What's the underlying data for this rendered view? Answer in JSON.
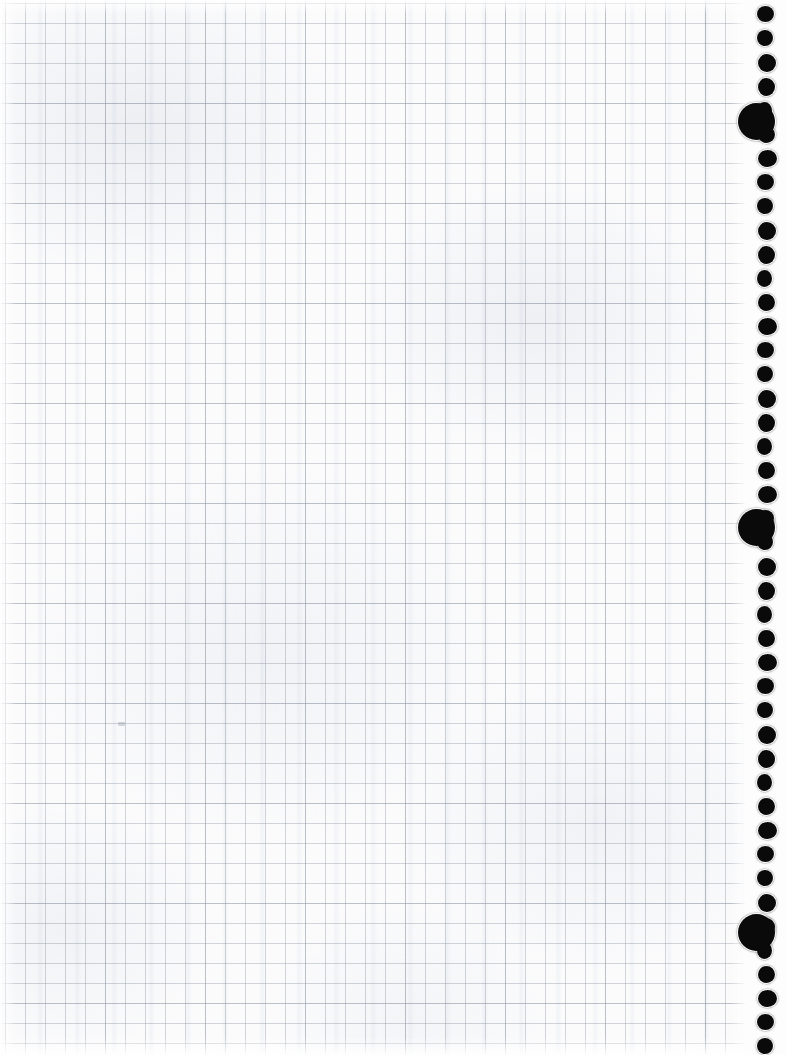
{
  "document": {
    "kind": "scanned-graph-paper-sheet",
    "title": "Blank quad-ruled graph paper page",
    "visible_text": "",
    "width_px": 786,
    "height_px": 1055
  },
  "paper": {
    "background_color": "#fbfbfc",
    "grid_line_color": "#969eaa",
    "grid_square_px": 20,
    "grid_origin_x_px": 5,
    "grid_origin_y_px": 3,
    "grid_area_width_px": 745,
    "accent_block_px": 100
  },
  "punch_margin": {
    "label": "spiral-bound punched edge",
    "left_px": 745,
    "width_px": 41,
    "background_color": "#fdfdfd",
    "hole_color": "#0a0a0a"
  },
  "holes": {
    "small_diameter_px": 17,
    "large_diameter_px": 37,
    "small_spacing_px": 24,
    "center_x_px": 766,
    "large_center_x_px": 756,
    "large_centers_y_px": [
      121,
      527,
      932
    ],
    "small_centers_y_px": [
      14,
      38,
      62,
      86,
      110,
      134,
      158,
      182,
      206,
      230,
      254,
      278,
      302,
      326,
      350,
      374,
      398,
      422,
      446,
      470,
      494,
      518,
      542,
      566,
      590,
      614,
      638,
      662,
      686,
      710,
      734,
      758,
      782,
      806,
      830,
      854,
      878,
      902,
      926,
      950,
      974,
      998,
      1022,
      1046
    ]
  },
  "marks": [
    {
      "name": "pencil-speck",
      "x_px": 118,
      "y_px": 722,
      "width_px": 7,
      "height_px": 4
    }
  ]
}
